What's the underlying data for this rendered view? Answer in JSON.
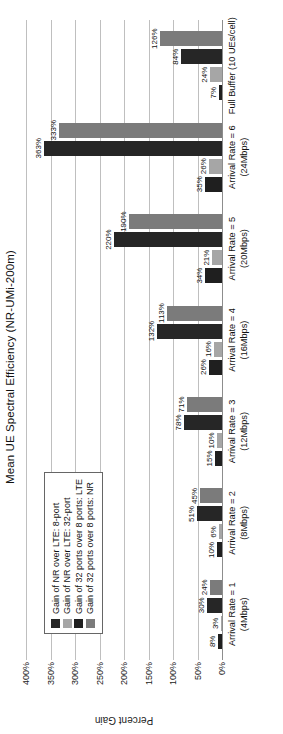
{
  "chart_data": {
    "type": "bar",
    "title": "Mean UE Spectral Efficiency (NR-UMi-200m)",
    "xlabel": "",
    "ylabel": "Percent Gain",
    "ylim": [
      0,
      400
    ],
    "grid": true,
    "legend_position": "upper-left-inside",
    "categories": [
      "Arrival Rate = 1\n(4Mbps)",
      "Arrival Rate = 2\n(8Mbps)",
      "Arrival Rate = 3\n(12Mbps)",
      "Arrival Rate = 4\n(16Mbps)",
      "Arrival Rate = 5\n(20Mbps)",
      "Arrival Rate = 6\n(24Mbps)",
      "Full Buffer (10 UEs/cell)"
    ],
    "category_lines": [
      [
        "Arrival Rate = 1",
        "(4Mbps)"
      ],
      [
        "Arrival Rate = 2",
        "(8Mbps)"
      ],
      [
        "Arrival Rate = 3",
        "(12Mbps)"
      ],
      [
        "Arrival Rate = 4",
        "(16Mbps)"
      ],
      [
        "Arrival Rate = 5",
        "(20Mbps)"
      ],
      [
        "Arrival Rate = 6",
        "(24Mbps)"
      ],
      [
        "Full Buffer (10 UEs/cell)",
        ""
      ]
    ],
    "ytick_labels": [
      "0%",
      "50%",
      "100%",
      "150%",
      "200%",
      "250%",
      "300%",
      "350%",
      "400%"
    ],
    "ytick_values": [
      0,
      50,
      100,
      150,
      200,
      250,
      300,
      350,
      400
    ],
    "series": [
      {
        "name": "Gain of 32 ports over 8 ports: LTE",
        "color": "#1f1f1f",
        "values": [
          8,
          10,
          15,
          26,
          34,
          35,
          7
        ],
        "labels": [
          "8%",
          "10%",
          "15%",
          "26%",
          "34%",
          "35%",
          "7%"
        ]
      },
      {
        "name": "Gain of 32 ports over 8 ports: NR",
        "color": "#a6a6a6",
        "values": [
          3,
          6,
          10,
          16,
          21,
          26,
          24
        ],
        "labels": [
          "3%",
          "6%",
          "10%",
          "16%",
          "21%",
          "26%",
          "24%"
        ]
      },
      {
        "name": "Gain of NR over LTE: 8-port",
        "color": "#262626",
        "values": [
          30,
          51,
          78,
          132,
          220,
          363,
          84
        ],
        "labels": [
          "30%",
          "51%",
          "78%",
          "132%",
          "220%",
          "363%",
          "84%"
        ]
      },
      {
        "name": "Gain of NR over LTE: 32-port",
        "color": "#7b7b7b",
        "values": [
          24,
          45,
          71,
          113,
          190,
          333,
          126
        ],
        "labels": [
          "24%",
          "45%",
          "71%",
          "113%",
          "190%",
          "333%",
          "126%"
        ]
      }
    ],
    "legend_entries": [
      {
        "label": "Gain of NR over LTE: 8-port",
        "color": "#262626"
      },
      {
        "label": "Gain of NR over LTE: 32-port",
        "color": "#a6a6a6"
      },
      {
        "label": "Gain of 32 ports over 8 ports: LTE",
        "color": "#1f1f1f"
      },
      {
        "label": "Gain of 32 ports over 8 ports: NR",
        "color": "#7b7b7b"
      }
    ],
    "series_draw_order": [
      {
        "series_index": 0,
        "color": "#1f1f1f"
      },
      {
        "series_index": 1,
        "color": "#a6a6a6"
      },
      {
        "series_index": 2,
        "color": "#262626"
      },
      {
        "series_index": 3,
        "color": "#7b7b7b"
      }
    ]
  }
}
